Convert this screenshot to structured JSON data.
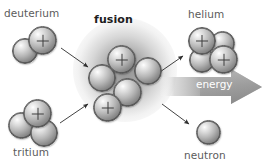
{
  "diagram": {
    "background_color": "#ffffff",
    "labels": {
      "deuterium": "deuterium",
      "fusion": "fusion",
      "helium": "helium",
      "tritium": "tritium",
      "neutron": "neutron",
      "energy": "energy"
    },
    "colors": {
      "label_text": "#5b5b5b",
      "title_text": "#1d1d1d",
      "energy_text": "#ffffff",
      "arrow_stroke": "#2e2e2e",
      "energy_arrow_fill": "#9a9a9a",
      "glow": "#787878",
      "sphere_light": "#ffffff",
      "sphere_dark": "#5f5f5f"
    },
    "groups": [
      {
        "name": "deuterium",
        "label": "deuterium",
        "nucleons": 2,
        "protons": 1,
        "neutrons": 1
      },
      {
        "name": "tritium",
        "label": "tritium",
        "nucleons": 3,
        "protons": 1,
        "neutrons": 2
      },
      {
        "name": "fusion-cluster",
        "label": "fusion",
        "nucleons": 5,
        "protons": 2,
        "neutrons": 3
      },
      {
        "name": "helium",
        "label": "helium",
        "nucleons": 4,
        "protons": 2,
        "neutrons": 2
      },
      {
        "name": "neutron",
        "label": "neutron",
        "nucleons": 1,
        "protons": 0,
        "neutrons": 1
      }
    ],
    "arrows": [
      {
        "name": "deuterium-to-fusion",
        "direction": "down-right"
      },
      {
        "name": "tritium-to-fusion",
        "direction": "up-right"
      },
      {
        "name": "fusion-to-helium",
        "direction": "up-right"
      },
      {
        "name": "fusion-to-neutron",
        "direction": "down-right"
      },
      {
        "name": "energy-release",
        "direction": "right"
      }
    ]
  }
}
